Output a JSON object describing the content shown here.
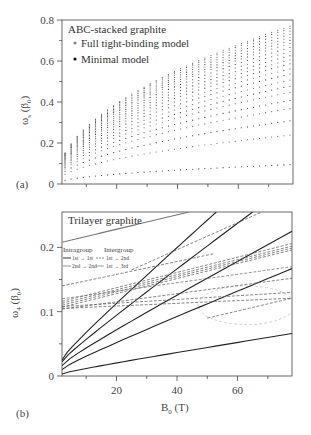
{
  "chart_data": [
    {
      "type": "scatter",
      "panel_label": "(a)",
      "title": "ABC-stacked graphite",
      "xlabel": "",
      "ylabel": "ωs (β0)",
      "ylabel_main": "ω",
      "ylabel_sub": "s",
      "ylabel_rest": " (β",
      "ylabel_rest_sub": "0",
      "ylabel_close": ")",
      "xlim": [
        2,
        78
      ],
      "ylim": [
        0,
        0.8
      ],
      "yticks": [
        0,
        0.2,
        0.4,
        0.6,
        0.8
      ],
      "ytick_labels": [
        "0",
        "0.2",
        "0.4",
        "0.6",
        "0.8"
      ],
      "xticks": [
        10,
        20,
        30,
        40,
        50,
        60,
        70
      ],
      "xtick_labels": [],
      "legend": [
        {
          "label": "Full tight-binding model",
          "color": "#888888"
        },
        {
          "label": "Minimal model",
          "color": "#111111"
        }
      ],
      "legend_position": "top-left",
      "series_model": "ω = a_n · sqrt(B0)",
      "series_end_values_at_B78": [
        0.095,
        0.24,
        0.31,
        0.37,
        0.41,
        0.45,
        0.48,
        0.51,
        0.54,
        0.565,
        0.59,
        0.61,
        0.63,
        0.65,
        0.67,
        0.69,
        0.705,
        0.72,
        0.735,
        0.75,
        0.765,
        0.775
      ],
      "b_samples": [
        3,
        5,
        7,
        9,
        11,
        13,
        15,
        17,
        19,
        21,
        23,
        25,
        27,
        29,
        31,
        33,
        35,
        37,
        39,
        41,
        43,
        45,
        47,
        49,
        51,
        53,
        55,
        57,
        59,
        61,
        63,
        65,
        67,
        69,
        71,
        73,
        75,
        77
      ]
    },
    {
      "type": "line",
      "panel_label": "(b)",
      "title": "Trilayer graphite",
      "xlabel": "B0 (T)",
      "xlabel_main": "B",
      "xlabel_sub": "0",
      "xlabel_rest": " (T)",
      "ylabel": "ω4 (β0)",
      "ylabel_main": "ω",
      "ylabel_sub": "4",
      "ylabel_rest": " (β",
      "ylabel_rest_sub": "0",
      "ylabel_close": ")",
      "xlim": [
        2,
        78
      ],
      "ylim": [
        0,
        0.255
      ],
      "yticks": [
        0,
        0.05,
        0.1,
        0.15,
        0.2
      ],
      "ytick_labels": [
        "0",
        "",
        "0.1",
        "",
        "0.2"
      ],
      "xticks": [
        10,
        20,
        30,
        40,
        50,
        60,
        70
      ],
      "xtick_labels": [
        "",
        "20",
        "",
        "40",
        "",
        "60",
        ""
      ],
      "legend": {
        "position": "top-left",
        "intragroup_title": "Intragroup",
        "intergroup_title": "Intergroup",
        "entries": [
          {
            "group": "Intragroup",
            "label": "1st → 1st",
            "style": "solid",
            "color": "#222222"
          },
          {
            "group": "Intragroup",
            "label": "2nd → 2nd",
            "style": "solid",
            "color": "#888888"
          },
          {
            "group": "Intergroup",
            "label": "1st → 2nd",
            "style": "dashed",
            "color": "#555555"
          },
          {
            "group": "Intergroup",
            "label": "1st → 3rd",
            "style": "solid-thin",
            "color": "#777777"
          }
        ]
      },
      "series": [
        {
          "name": "intra-1st-a",
          "style": "solid",
          "color": "#222222",
          "x": [
            2,
            78
          ],
          "y": [
            0.003,
            0.066
          ],
          "shape": 0.15
        },
        {
          "name": "intra-1st-b",
          "style": "solid",
          "color": "#222222",
          "x": [
            2,
            78
          ],
          "y": [
            0.01,
            0.167
          ],
          "shape": 0.12
        },
        {
          "name": "intra-1st-c",
          "style": "solid",
          "color": "#222222",
          "x": [
            2,
            78
          ],
          "y": [
            0.016,
            0.225
          ],
          "shape": 0.12
        },
        {
          "name": "intra-1st-d",
          "style": "solid",
          "color": "#222222",
          "x": [
            2,
            65
          ],
          "y": [
            0.022,
            0.255
          ],
          "shape": 0.1
        },
        {
          "name": "intra-1st-e",
          "style": "solid",
          "color": "#222222",
          "x": [
            2,
            53
          ],
          "y": [
            0.025,
            0.255
          ],
          "shape": 0.12
        },
        {
          "name": "intra-2nd",
          "style": "solid",
          "color": "#777777",
          "x": [
            2,
            44
          ],
          "y": [
            0.208,
            0.255
          ],
          "shape": 0
        },
        {
          "name": "inter-1",
          "style": "dashed",
          "color": "#666666",
          "x": [
            2,
            52
          ],
          "y": [
            0.14,
            0.19
          ],
          "shape": 0
        },
        {
          "name": "inter-2",
          "style": "dashed",
          "color": "#666666",
          "x": [
            2,
            78
          ],
          "y": [
            0.116,
            0.206
          ],
          "shape": 0
        },
        {
          "name": "inter-3",
          "style": "dashed",
          "color": "#666666",
          "x": [
            2,
            78
          ],
          "y": [
            0.113,
            0.202
          ],
          "shape": 0
        },
        {
          "name": "inter-4",
          "style": "dashed",
          "color": "#666666",
          "x": [
            2,
            78
          ],
          "y": [
            0.11,
            0.199
          ],
          "shape": 0
        },
        {
          "name": "inter-5",
          "style": "dashed",
          "color": "#666666",
          "x": [
            2,
            78
          ],
          "y": [
            0.107,
            0.196
          ],
          "shape": 0
        },
        {
          "name": "inter-6",
          "style": "dashed",
          "color": "#666666",
          "x": [
            2,
            78
          ],
          "y": [
            0.104,
            0.152
          ],
          "shape": 0
        },
        {
          "name": "inter-7",
          "style": "dashed",
          "color": "#666666",
          "x": [
            2,
            78
          ],
          "y": [
            0.108,
            0.13
          ],
          "shape": 0
        },
        {
          "name": "inter-8",
          "style": "dashed",
          "color": "#666666",
          "x": [
            2,
            78
          ],
          "y": [
            0.105,
            0.121
          ],
          "shape": 0
        },
        {
          "name": "inter-9",
          "style": "dashed",
          "color": "#666666",
          "x": [
            25,
            68
          ],
          "y": [
            0.165,
            0.255
          ],
          "shape": 0
        },
        {
          "name": "inter-10",
          "style": "dashed",
          "color": "#777777",
          "x": [
            2,
            78
          ],
          "y": [
            0.12,
            0.17
          ],
          "shape": 0
        },
        {
          "name": "inter-11",
          "style": "dashed",
          "color": "#666666",
          "x": [
            50,
            78
          ],
          "y": [
            0.09,
            0.121
          ],
          "shape": 0
        }
      ],
      "annotation_ellipse": {
        "center": [
          63,
          0.11
        ],
        "radii": [
          16,
          0.03
        ],
        "style": "dashed",
        "color": "#cccccc"
      }
    }
  ]
}
